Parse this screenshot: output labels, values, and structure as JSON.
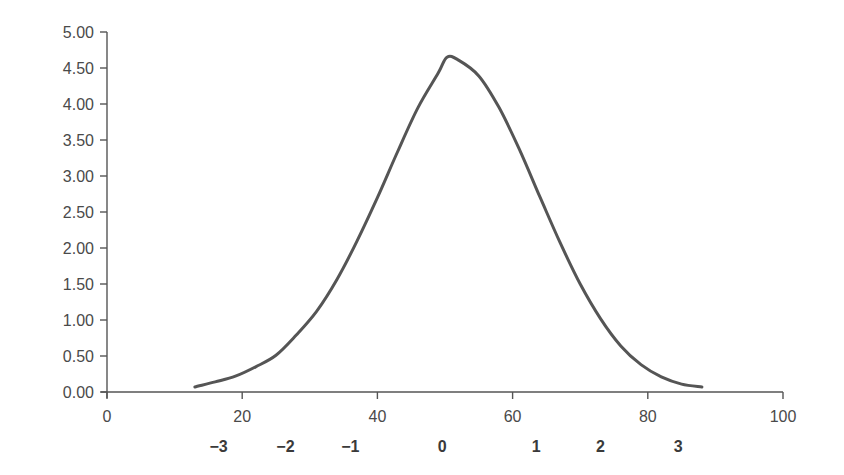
{
  "chart_data": {
    "type": "line",
    "title": "",
    "xlabel": "",
    "ylabel": "",
    "xlim": [
      0,
      100
    ],
    "ylim": [
      0,
      5
    ],
    "grid": false,
    "legend": null,
    "x_ticks": [
      "0",
      "20",
      "40",
      "60",
      "80",
      "100"
    ],
    "y_ticks": [
      "0.00",
      "0.50",
      "1.00",
      "1.50",
      "2.00",
      "2.50",
      "3.00",
      "3.50",
      "4.00",
      "4.50",
      "5.00"
    ],
    "z_score_labels": [
      {
        "label": "−3",
        "x": 16.5
      },
      {
        "label": "−2",
        "x": 26.4
      },
      {
        "label": "−1",
        "x": 36.0
      },
      {
        "label": "0",
        "x": 49.6
      },
      {
        "label": "1",
        "x": 63.5
      },
      {
        "label": "2",
        "x": 73.0
      },
      {
        "label": "3",
        "x": 84.5
      }
    ],
    "series": [
      {
        "name": "normal curve",
        "color": "#555555",
        "x": [
          13,
          16,
          19,
          22,
          25,
          28,
          31,
          34,
          37,
          40,
          43,
          46,
          49,
          50.3,
          52,
          55,
          58,
          61,
          64,
          67,
          70,
          73,
          76,
          79,
          82,
          85,
          88
        ],
        "values": [
          0.07,
          0.14,
          0.22,
          0.35,
          0.51,
          0.79,
          1.12,
          1.56,
          2.1,
          2.7,
          3.34,
          3.95,
          4.43,
          4.65,
          4.61,
          4.39,
          3.95,
          3.37,
          2.72,
          2.08,
          1.5,
          1.02,
          0.64,
          0.38,
          0.21,
          0.11,
          0.07
        ]
      }
    ]
  }
}
